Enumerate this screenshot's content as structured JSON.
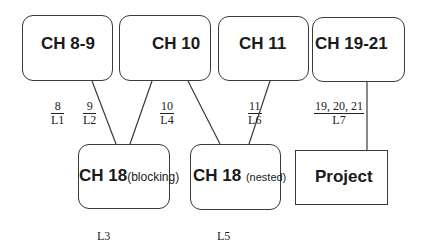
{
  "diagram": {
    "top_nodes": [
      {
        "id": "ch8-9",
        "label": "CH 8-9"
      },
      {
        "id": "ch10",
        "label": "CH 10"
      },
      {
        "id": "ch11",
        "label": "CH 11"
      },
      {
        "id": "ch19-21",
        "label": "CH 19-21"
      }
    ],
    "bottom_nodes": [
      {
        "id": "ch18-blocking",
        "label": "CH 18",
        "sublabel": "(blocking)",
        "caption": "L3"
      },
      {
        "id": "ch18-nested",
        "label": "CH 18",
        "sublabel": "(nested)",
        "caption": "L5"
      },
      {
        "id": "project",
        "label": "Project"
      }
    ],
    "edge_labels": [
      {
        "num": "8",
        "den": "L1"
      },
      {
        "num": "9",
        "den": "L2"
      },
      {
        "num": "10",
        "den": "L4"
      },
      {
        "num": "11",
        "den": "L6"
      },
      {
        "num": "19, 20, 21",
        "den": "L7"
      }
    ],
    "edges": [
      {
        "from": "ch8-9",
        "to": "ch18-blocking"
      },
      {
        "from": "ch10",
        "to": "ch18-blocking"
      },
      {
        "from": "ch10",
        "to": "ch18-nested"
      },
      {
        "from": "ch11",
        "to": "ch18-nested"
      },
      {
        "from": "ch19-21",
        "to": "project"
      }
    ],
    "colors": {
      "stroke": "#3a3a3a",
      "text": "#1a1a1a",
      "background": "#ffffff"
    }
  }
}
